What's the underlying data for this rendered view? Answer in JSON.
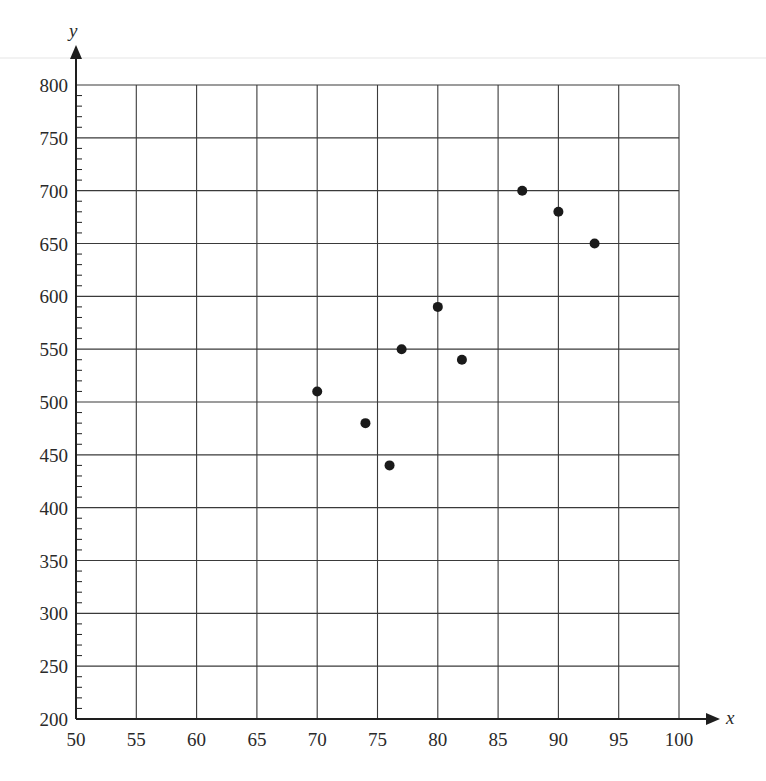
{
  "chart_data": {
    "type": "scatter",
    "title": "",
    "xlabel": "x",
    "ylabel": "y",
    "xlim": [
      50,
      100
    ],
    "ylim": [
      200,
      800
    ],
    "x_ticks": [
      50,
      55,
      60,
      65,
      70,
      75,
      80,
      85,
      90,
      95,
      100
    ],
    "y_ticks": [
      200,
      250,
      300,
      350,
      400,
      450,
      500,
      550,
      600,
      650,
      700,
      750,
      800
    ],
    "y_minor_tick_step": 10,
    "grid": true,
    "legend": null,
    "points": [
      {
        "x": 70,
        "y": 510
      },
      {
        "x": 74,
        "y": 480
      },
      {
        "x": 76,
        "y": 440
      },
      {
        "x": 77,
        "y": 550
      },
      {
        "x": 80,
        "y": 590
      },
      {
        "x": 82,
        "y": 540
      },
      {
        "x": 87,
        "y": 700
      },
      {
        "x": 90,
        "y": 680
      },
      {
        "x": 93,
        "y": 650
      }
    ],
    "x": [
      70,
      74,
      76,
      77,
      80,
      82,
      87,
      90,
      93
    ],
    "series": [
      {
        "name": "data",
        "values": [
          510,
          480,
          440,
          550,
          590,
          540,
          700,
          680,
          650
        ]
      }
    ]
  },
  "colors": {
    "axis": "#1e1e1e",
    "grid": "#3a3a3a",
    "point": "#1a1a1a",
    "text": "#2a2a2a",
    "scan_line": "#e6e6e6"
  },
  "labels": {
    "x_axis": "x",
    "y_axis": "y"
  }
}
